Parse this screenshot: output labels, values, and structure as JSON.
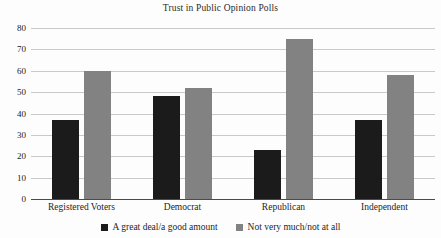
{
  "chart_data": {
    "type": "bar",
    "title": "Trust in Public Opinion Polls",
    "xlabel": "",
    "ylabel": "",
    "categories": [
      "Registered Voters",
      "Democrat",
      "Republican",
      "Independent"
    ],
    "series": [
      {
        "name": "A great deal/a good amount",
        "color": "#1b1b1b",
        "values": [
          37,
          48,
          23,
          37
        ]
      },
      {
        "name": "Not very much/not at all",
        "color": "#828282",
        "values": [
          60,
          52,
          75,
          58
        ]
      }
    ],
    "ylim": [
      0,
      80
    ],
    "yticks": [
      0,
      10,
      20,
      30,
      40,
      50,
      60,
      70,
      80
    ],
    "ytick_labels": [
      "0",
      "10",
      "20",
      "30",
      "40",
      "50",
      "60",
      "70",
      "80"
    ],
    "grid": true,
    "grid_axis": "y",
    "legend_position": "bottom",
    "background_color": "#fdfdfd",
    "gridline_color": "#c9c9c9",
    "axis_color": "#4a4a4a"
  }
}
